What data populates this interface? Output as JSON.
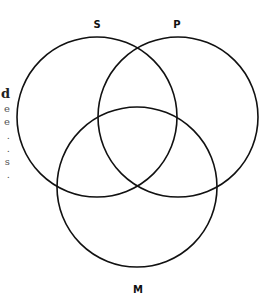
{
  "diagram": {
    "type": "venn",
    "sets": [
      {
        "label": "S",
        "cx": 97,
        "cy": 117,
        "r": 80
      },
      {
        "label": "P",
        "cx": 178,
        "cy": 117,
        "r": 80
      },
      {
        "label": "M",
        "cx": 137,
        "cy": 187,
        "r": 80
      }
    ],
    "stroke_color": "#111111",
    "labels": {
      "s": "S",
      "p": "P",
      "m": "M"
    }
  },
  "edge_text": {
    "lines": [
      "d",
      "e",
      "e",
      ".",
      ".",
      "s",
      "."
    ]
  }
}
